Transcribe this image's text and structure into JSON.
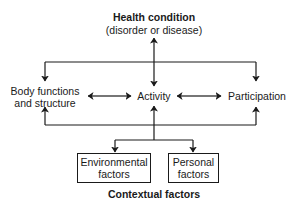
{
  "diagram": {
    "top": {
      "title": "Health condition",
      "subtitle": "(disorder or disease)"
    },
    "middle_row": {
      "left_line1": "Body functions",
      "left_line2": "and structure",
      "center": "Activity",
      "right": "Participation"
    },
    "boxes": {
      "environmental_line1": "Environmental",
      "environmental_line2": "factors",
      "personal_line1": "Personal",
      "personal_line2": "factors"
    },
    "bottom": {
      "title": "Contextual factors"
    },
    "colors": {
      "line": "#1a1a1a",
      "background": "#ffffff"
    }
  }
}
